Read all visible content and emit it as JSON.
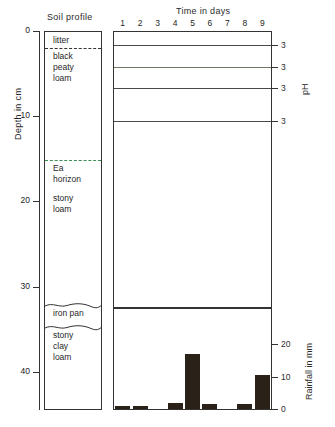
{
  "figure": {
    "depth_axis_title": "Depth in cm",
    "soil_profile_title": "Soil profile",
    "time_axis_title": "Time in days",
    "ph_axis_title": "pH",
    "rain_axis_title": "Rainfall in mm"
  },
  "depth_axis": {
    "unit": "cm",
    "ticks": [
      {
        "value": 0,
        "label": "0"
      },
      {
        "value": 10,
        "label": "10"
      },
      {
        "value": 20,
        "label": "20"
      },
      {
        "value": 30,
        "label": "30"
      },
      {
        "value": 40,
        "label": "40"
      }
    ]
  },
  "soil_horizons": [
    {
      "name": "litter",
      "label": "litter",
      "top_cm": 0.0,
      "bottom_cm": 1.9,
      "boundary": "dashed"
    },
    {
      "name": "black-peaty-loam",
      "label": "black\npeaty\nloam",
      "top_cm": 1.9,
      "bottom_cm": 15.0,
      "boundary": "dashed-green"
    },
    {
      "name": "ea-horizon",
      "label": "Ea\nhorizon",
      "top_cm": 15.0,
      "bottom_cm": 18.5,
      "boundary": "none"
    },
    {
      "name": "stony-loam",
      "label": "stony\nloam",
      "top_cm": 18.5,
      "bottom_cm": 32.0,
      "boundary": "wavy"
    },
    {
      "name": "iron-pan",
      "label": "iron  pan",
      "top_cm": 32.0,
      "bottom_cm": 34.6,
      "boundary": "wavy"
    },
    {
      "name": "stony-clay-loam",
      "label": "stony\nclay\nloam",
      "top_cm": 34.6,
      "bottom_cm": 44.5,
      "boundary": "none"
    }
  ],
  "chart_data": [
    {
      "type": "line",
      "name": "soil-ph-over-time",
      "title": "",
      "xlabel": "Time in days",
      "ylabel": "pH",
      "x": [
        1,
        2,
        3,
        4,
        5,
        6,
        7,
        8,
        9
      ],
      "xlim": [
        0.5,
        9.5
      ],
      "grid": false,
      "legend": "none",
      "axis_note": "each trace has its own pH scale marked 3 at the right",
      "series": [
        {
          "name": "litter",
          "tick_label": "3",
          "depth_cm": 1,
          "color": "#4a4a4a",
          "values": [
            3.0,
            3.0,
            3.0,
            3.0,
            3.0,
            3.0,
            3.0,
            3.0,
            3.0
          ]
        },
        {
          "name": "black peaty loam",
          "tick_label": "3",
          "depth_cm": 6,
          "color": "#6f7a62",
          "values": [
            3.0,
            3.0,
            3.0,
            3.0,
            3.0,
            3.0,
            3.0,
            3.0,
            3.0
          ]
        },
        {
          "name": "Ea horizon",
          "tick_label": "3",
          "depth_cm": 12,
          "color": "#4a4a4a",
          "values": [
            3.0,
            3.0,
            3.0,
            3.0,
            3.0,
            3.0,
            3.0,
            3.0,
            3.0
          ]
        },
        {
          "name": "stony loam",
          "tick_label": "3",
          "depth_cm": 22,
          "color": "#4a4a4a",
          "values": [
            3.0,
            3.0,
            3.0,
            3.0,
            3.0,
            3.0,
            3.0,
            3.0,
            3.0
          ]
        }
      ]
    },
    {
      "type": "bar",
      "name": "daily-rainfall",
      "title": "",
      "xlabel": "Time in days",
      "ylabel": "Rainfall in mm",
      "categories": [
        "1",
        "2",
        "3",
        "4",
        "5",
        "6",
        "7",
        "8",
        "9"
      ],
      "values": [
        1.0,
        1.0,
        0.0,
        2.0,
        17.0,
        1.5,
        0.0,
        1.5,
        10.5
      ],
      "ylim": [
        0,
        25
      ],
      "yticks": [
        0,
        10,
        20
      ],
      "ytick_labels": [
        "0",
        "10",
        "20"
      ],
      "bar_color": "#2a2118",
      "grid": false,
      "legend": "none"
    }
  ],
  "time_axis": {
    "ticks": [
      "1",
      "2",
      "3",
      "4",
      "5",
      "6",
      "7",
      "8",
      "9"
    ]
  }
}
